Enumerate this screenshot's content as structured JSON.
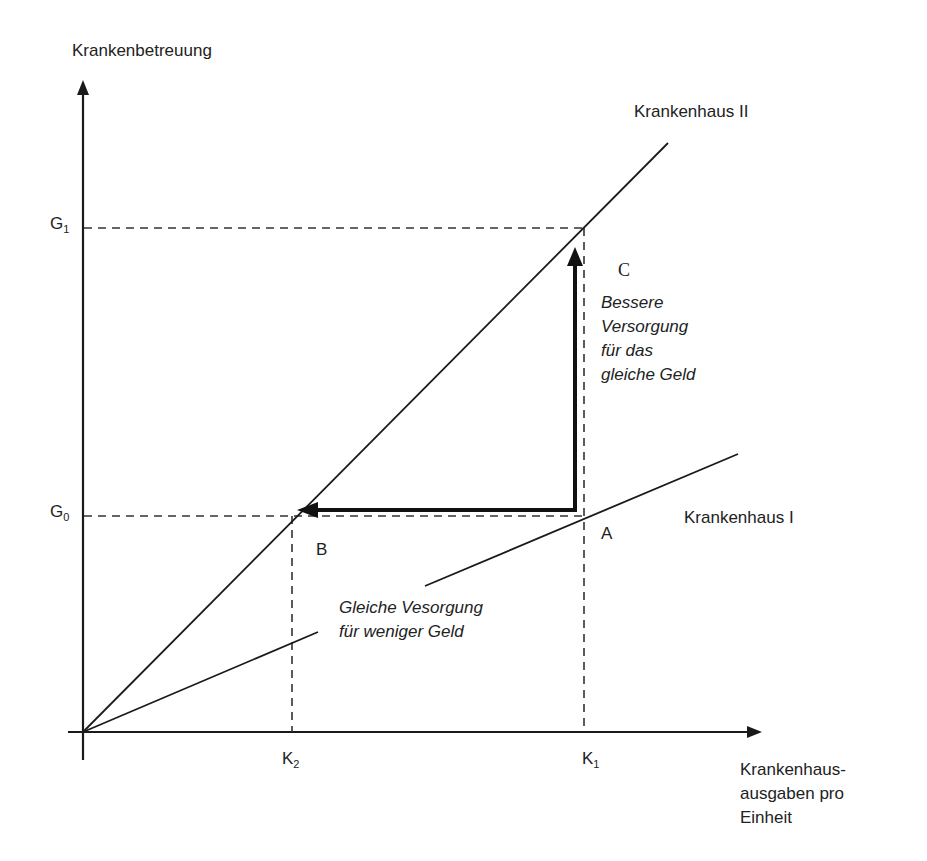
{
  "diagram": {
    "y_axis_label": "Krankenbetreuung",
    "x_axis_label": "Krankenhaus-\nausgaben pro\nEinheit",
    "ticks": {
      "G1": {
        "base": "G",
        "sub": "1"
      },
      "G0": {
        "base": "G",
        "sub": "0"
      },
      "K1": {
        "base": "K",
        "sub": "1"
      },
      "K2": {
        "base": "K",
        "sub": "2"
      }
    },
    "lines": {
      "hospital_2": "Krankenhaus II",
      "hospital_1": "Krankenhaus I"
    },
    "points": {
      "A": "A",
      "B": "B",
      "C": "C"
    },
    "annotations": {
      "better_care": "Bessere\nVersorgung\nfür das\ngleiche Geld",
      "same_care": "Gleiche Vesorgung\nfür weniger Geld"
    },
    "colors": {
      "line": "#1a1a1a",
      "background": "#ffffff"
    }
  }
}
